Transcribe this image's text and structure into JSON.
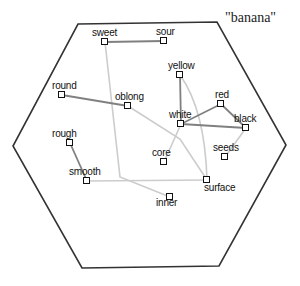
{
  "title": "\"banana\"",
  "colors": {
    "hexagon_stroke": "#333333",
    "strong_edge": "#808080",
    "weak_edge": "#cccccc",
    "node_stroke": "#111111",
    "background": "#ffffff"
  },
  "hexagon": [
    [
      78,
      24
    ],
    [
      217,
      22
    ],
    [
      286,
      145
    ],
    [
      219,
      266
    ],
    [
      82,
      268
    ],
    [
      13,
      146
    ]
  ],
  "nodes": [
    {
      "id": "sweet",
      "label": "sweet",
      "x": 105,
      "y": 42,
      "lx": -13,
      "ly": -14
    },
    {
      "id": "sour",
      "label": "sour",
      "x": 164,
      "y": 41,
      "lx": -8,
      "ly": -14
    },
    {
      "id": "yellow",
      "label": "yellow",
      "x": 180,
      "y": 75,
      "lx": -12,
      "ly": -14
    },
    {
      "id": "round",
      "label": "round",
      "x": 62,
      "y": 95,
      "lx": -10,
      "ly": -14
    },
    {
      "id": "oblong",
      "label": "oblong",
      "x": 128,
      "y": 106,
      "lx": -13,
      "ly": -14
    },
    {
      "id": "red",
      "label": "red",
      "x": 221,
      "y": 104,
      "lx": -6,
      "ly": -14
    },
    {
      "id": "white",
      "label": "white",
      "x": 181,
      "y": 124,
      "lx": -12,
      "ly": -14
    },
    {
      "id": "black",
      "label": "black",
      "x": 246,
      "y": 128,
      "lx": -12,
      "ly": -14
    },
    {
      "id": "rough",
      "label": "rough",
      "x": 70,
      "y": 143,
      "lx": -18,
      "ly": -14
    },
    {
      "id": "seeds",
      "label": "seeds",
      "x": 225,
      "y": 157,
      "lx": -12,
      "ly": -14
    },
    {
      "id": "core",
      "label": "core",
      "x": 164,
      "y": 162,
      "lx": -12,
      "ly": -14
    },
    {
      "id": "smooth",
      "label": "smooth",
      "x": 87,
      "y": 181,
      "lx": -18,
      "ly": -14
    },
    {
      "id": "surface",
      "label": "surface",
      "x": 207,
      "y": 180,
      "lx": -3,
      "ly": 3
    },
    {
      "id": "inner",
      "label": "inner",
      "x": 170,
      "y": 197,
      "lx": -14,
      "ly": 1
    }
  ],
  "edges": [
    {
      "from": "sweet",
      "to": "sour",
      "strength": "strong"
    },
    {
      "from": "round",
      "to": "oblong",
      "strength": "strong"
    },
    {
      "from": "rough",
      "to": "smooth",
      "strength": "strong"
    },
    {
      "from": "yellow",
      "to": "white",
      "strength": "strong"
    },
    {
      "from": "white",
      "to": "red",
      "strength": "strong"
    },
    {
      "from": "red",
      "to": "black",
      "strength": "strong"
    },
    {
      "from": "white",
      "to": "black",
      "strength": "strong"
    },
    {
      "from": "sweet",
      "to": "inner",
      "strength": "weak",
      "via": [
        [
          120,
          177
        ]
      ]
    },
    {
      "from": "oblong",
      "to": "surface",
      "strength": "weak",
      "via": [
        [
          180,
          139
        ]
      ]
    },
    {
      "from": "white",
      "to": "core",
      "strength": "weak"
    },
    {
      "from": "yellow",
      "to": "surface",
      "strength": "weak",
      "curve": [
        205,
        110
      ]
    },
    {
      "from": "smooth",
      "to": "surface",
      "strength": "weak"
    },
    {
      "from": "black",
      "to": "seeds",
      "strength": "weak"
    }
  ]
}
